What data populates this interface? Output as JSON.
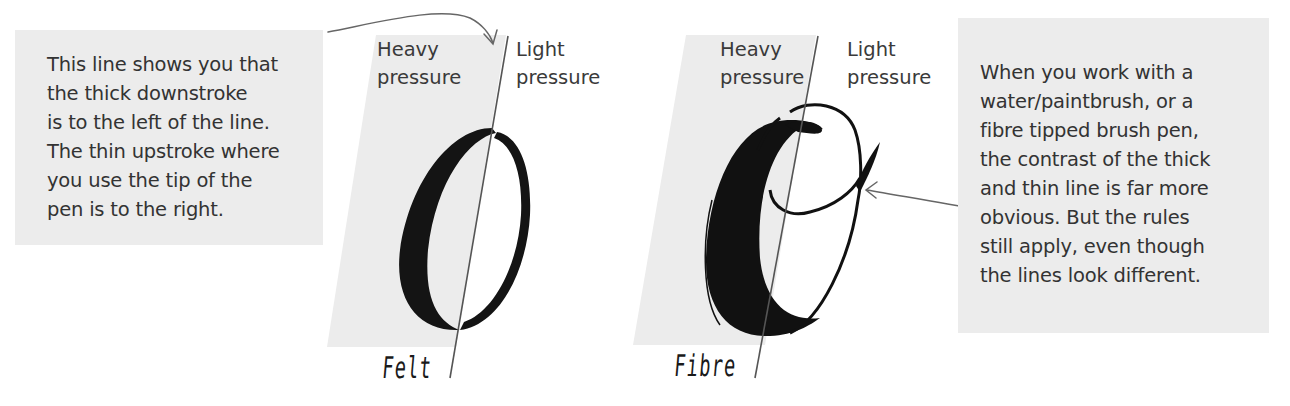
{
  "notes": {
    "left": {
      "lines": [
        "This line shows you that",
        "the thick downstroke",
        "is to the left of the line.",
        "The thin upstroke where",
        "you use the tip of the",
        "pen is to the right."
      ]
    },
    "right": {
      "lines": [
        "When you work with a",
        "water/paintbrush, or a",
        "fibre tipped brush pen,",
        "the contrast of the thick",
        "and thin line is far more",
        "obvious. But the rules",
        "still apply, even though",
        "the lines look different."
      ]
    }
  },
  "panels": [
    {
      "pen": "Felt",
      "heavy_label": [
        "Heavy",
        "pressure"
      ],
      "light_label": [
        "Light",
        "pressure"
      ],
      "letter": "O"
    },
    {
      "pen": "Fibre",
      "heavy_label": [
        "Heavy",
        "pressure"
      ],
      "light_label": [
        "Light",
        "pressure"
      ],
      "letter": "O"
    }
  ],
  "colors": {
    "box_background": "#ececec",
    "text": "#333333",
    "ink": "#111111",
    "guide_line": "#555555",
    "arrow": "#666666"
  }
}
